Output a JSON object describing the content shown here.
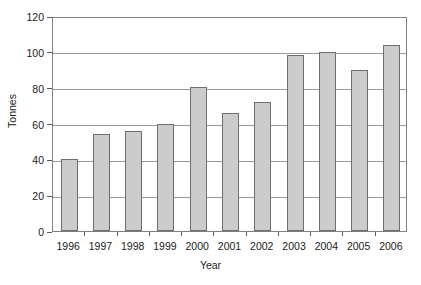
{
  "chart_data": {
    "type": "bar",
    "title": "",
    "xlabel": "Year",
    "ylabel": "Tonnes",
    "categories": [
      "1996",
      "1997",
      "1998",
      "1999",
      "2000",
      "2001",
      "2002",
      "2003",
      "2004",
      "2005",
      "2006"
    ],
    "values": [
      40,
      54,
      56,
      60,
      80.5,
      66,
      72,
      98,
      100,
      90,
      104
    ],
    "ylim": [
      0,
      120
    ],
    "ytick_labels": [
      "0",
      "20",
      "40",
      "60",
      "80",
      "100",
      "120"
    ],
    "ytick_values": [
      0,
      20,
      40,
      60,
      80,
      100,
      120
    ],
    "grid": "horizontal",
    "legend": "none",
    "bar_fill_color": "#cccccc",
    "bar_border_color": "#6e6e6e",
    "gridline_color": "#9a9a9a",
    "axis_color": "#808080",
    "text_color": "#1a1a1a"
  }
}
